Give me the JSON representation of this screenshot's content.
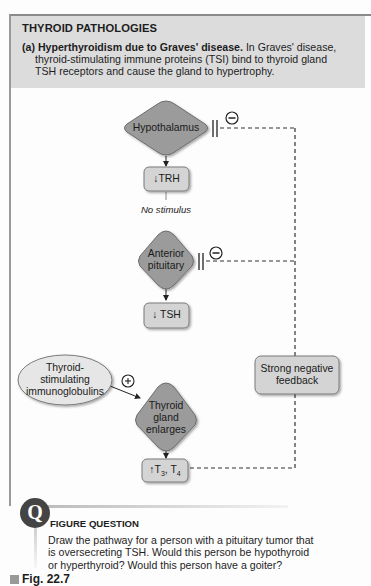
{
  "header": {
    "title": "THYROID PATHOLOGIES",
    "label": "(a)",
    "bold_text": "Hyperthyroidism due to Graves' disease.",
    "line1_rest": "In Graves' disease,",
    "line2": "thyroid-stimulating immune proteins (TSI) bind to thyroid gland",
    "line3": "TSH receptors and cause the gland to hypertrophy."
  },
  "diagram": {
    "hypothalamus": "Hypothalamus",
    "trh": "TRH",
    "trh_arrow": "↓",
    "no_stimulus": "No stimulus",
    "anterior_pituitary_1": "Anterior",
    "anterior_pituitary_2": "pituitary",
    "tsh": "TSH",
    "tsh_arrow": "↓",
    "tsi_1": "Thyroid-",
    "tsi_2": "stimulating",
    "tsi_3": "immunoglobulins",
    "plus_sign": "+",
    "minus_sign": "−",
    "thyroid_1": "Thyroid",
    "thyroid_2": "gland",
    "thyroid_3": "enlarges",
    "t3t4_arrow": "↑",
    "t3": "T",
    "t3_sub": "3",
    "sep": ", ",
    "t4": "T",
    "t4_sub": "4",
    "feedback_1": "Strong negative",
    "feedback_2": "feedback"
  },
  "question": {
    "icon": "Q",
    "title": "FIGURE QUESTION",
    "line1": "Draw the pathway for a person with a pituitary tumor that",
    "line2": "is oversecreting TSH. Would this person be hypothyroid",
    "line3": "or hyperthyroid? Would this person have a goiter?"
  },
  "figure_label": "Fig. 22.7",
  "colors": {
    "header_bg": "#dcdcdc",
    "diamond_fill": "#9b9b9b",
    "box_fill": "#d4d4d4",
    "ellipse_fill": "#e6e6e6"
  }
}
